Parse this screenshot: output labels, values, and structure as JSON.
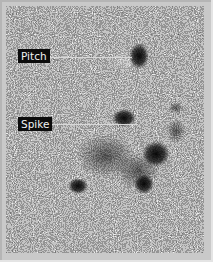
{
  "image": {
    "description": "Grainy grayscale SAR-like texture image with annotated dark features",
    "frame_color": "#c9c9c9",
    "background_tone": "#4a4a4a"
  },
  "annotations": [
    {
      "label": "Pitch",
      "x": 12,
      "y": 43,
      "line_to_x": 126,
      "line_y": 57
    },
    {
      "label": "Spike",
      "x": 12,
      "y": 111,
      "line_to_x": 132,
      "line_y": 124
    }
  ]
}
